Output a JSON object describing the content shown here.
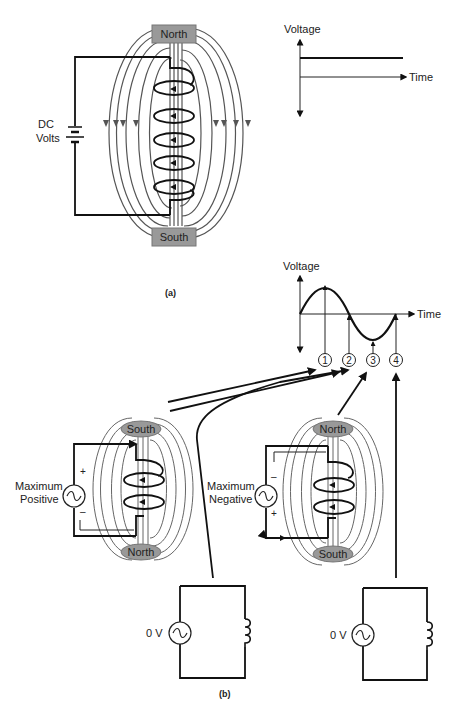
{
  "part_a": {
    "label": "(a)",
    "source_label_line1": "DC",
    "source_label_line2": "Volts",
    "pole_top": "North",
    "pole_bottom": "South",
    "graph": {
      "y_axis_label": "Voltage",
      "x_axis_label": "Time",
      "description": "Constant DC voltage line"
    }
  },
  "part_b": {
    "label": "(b)",
    "graph": {
      "y_axis_label": "Voltage",
      "x_axis_label": "Time",
      "markers": [
        "1",
        "2",
        "3",
        "4"
      ]
    },
    "left_magnet": {
      "source_label_line1": "Maximum",
      "source_label_line2": "Positive",
      "plus": "+",
      "minus": "–",
      "pole_top": "South",
      "pole_bottom": "North"
    },
    "right_magnet": {
      "source_label_line1": "Maximum",
      "source_label_line2": "Negative",
      "plus": "+",
      "minus": "–",
      "pole_top": "North",
      "pole_bottom": "South"
    },
    "zero_circuit_left": {
      "source_label": "0 V"
    },
    "zero_circuit_right": {
      "source_label": "0 V"
    }
  },
  "colors": {
    "line": "#111111",
    "field_line": "#555555",
    "pole_fill": "#999999"
  }
}
